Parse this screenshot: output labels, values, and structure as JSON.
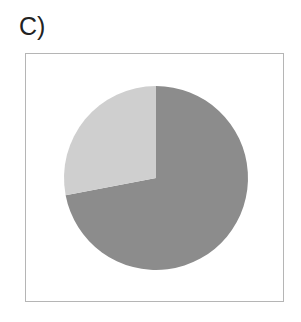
{
  "panel": {
    "label": "C)"
  },
  "chart_data": {
    "type": "pie",
    "title": "",
    "categories": [
      "Dark slice",
      "Light slice"
    ],
    "values": [
      72,
      28
    ],
    "colors": [
      "#8c8c8c",
      "#cfcfcf"
    ],
    "start_angle_deg": 90,
    "direction": "clockwise",
    "legend": "none"
  }
}
